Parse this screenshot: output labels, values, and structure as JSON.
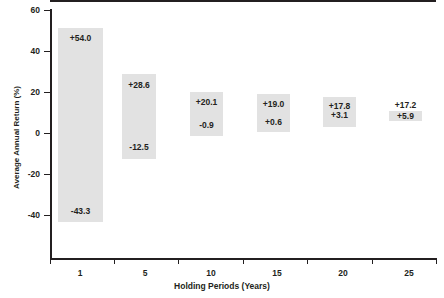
{
  "chart_data": {
    "type": "bar",
    "title": "",
    "xlabel": "Holding Periods (Years)",
    "ylabel": "Average Annual Return (%)",
    "categories": [
      "1",
      "5",
      "10",
      "15",
      "20",
      "25"
    ],
    "ylim": [
      -52,
      60
    ],
    "yticks": [
      60,
      40,
      20,
      0,
      -20,
      -40
    ],
    "ytick_labels": [
      "60",
      "40",
      "20",
      "0",
      "-20",
      "-40"
    ],
    "grid": false,
    "legend": null,
    "series": [
      {
        "name": "Best Average Annual Return",
        "values": [
          54.0,
          28.6,
          20.1,
          19.0,
          17.8,
          17.2
        ],
        "labels": [
          "+54.0",
          "+28.6",
          "+20.1",
          "+19.0",
          "+17.8",
          "+17.2"
        ]
      },
      {
        "name": "Worst Average Annual Return",
        "values": [
          -43.3,
          -12.5,
          -0.9,
          0.6,
          3.1,
          5.9
        ],
        "labels": [
          "-43.3",
          "-12.5",
          "-0.9",
          "+0.6",
          "+3.1",
          "+5.9"
        ]
      }
    ],
    "bar_color": "#e2e2e2",
    "axis_color": "#231f20",
    "zero_reference_line": 0
  },
  "bars": [
    {
      "category": "1",
      "high_label": "+54.0",
      "low_label": "-43.3",
      "x": 58,
      "width": 45,
      "top": 28,
      "bottom": 222,
      "high_label_x": 58,
      "high_label_y": 33,
      "high_label_w": 45,
      "low_label_x": 58,
      "low_label_y": 206,
      "low_label_w": 45
    },
    {
      "category": "5",
      "high_label": "+28.6",
      "low_label": "-12.5",
      "x": 122,
      "width": 34,
      "top": 74,
      "bottom": 159,
      "high_label_x": 120,
      "high_label_y": 80,
      "high_label_w": 38,
      "low_label_x": 120,
      "low_label_y": 142,
      "low_label_w": 38
    },
    {
      "category": "10",
      "high_label": "+20.1",
      "low_label": "-0.9",
      "x": 190,
      "width": 33,
      "top": 92,
      "bottom": 136,
      "high_label_x": 189,
      "high_label_y": 97,
      "high_label_w": 35,
      "low_label_x": 189,
      "low_label_y": 120,
      "low_label_w": 35
    },
    {
      "category": "15",
      "high_label": "+19.0",
      "low_label": "+0.6",
      "x": 257,
      "width": 33,
      "top": 94,
      "bottom": 132,
      "high_label_x": 256,
      "high_label_y": 99,
      "high_label_w": 35,
      "low_label_x": 256,
      "low_label_y": 117,
      "low_label_w": 35
    },
    {
      "category": "20",
      "high_label": "+17.8",
      "low_label": "+3.1",
      "x": 323,
      "width": 33,
      "top": 97,
      "bottom": 127,
      "high_label_x": 322,
      "high_label_y": 101,
      "high_label_w": 35,
      "low_label_x": 322,
      "low_label_y": 110,
      "low_label_w": 35
    },
    {
      "category": "25",
      "high_label": "+17.2",
      "low_label": "+5.9",
      "x": 389,
      "width": 33,
      "top": 111,
      "bottom": 121,
      "high_label_x": 388,
      "high_label_y": 100,
      "high_label_w": 35,
      "low_label_x": 388,
      "low_label_y": 111,
      "low_label_w": 35
    }
  ],
  "axis": {
    "y_ticks": [
      {
        "label": "60",
        "y": 10
      },
      {
        "label": "40",
        "y": 51
      },
      {
        "label": "20",
        "y": 92
      },
      {
        "label": "0",
        "y": 133
      },
      {
        "label": "-20",
        "y": 174
      },
      {
        "label": "-40",
        "y": 215
      }
    ],
    "x_ticks": [
      {
        "label": "1",
        "label_x": 80,
        "tick_x": 50
      },
      {
        "label": "5",
        "label_x": 145,
        "tick_x": 114
      },
      {
        "label": "10",
        "label_x": 211,
        "tick_x": 178
      },
      {
        "label": "15",
        "label_x": 277,
        "tick_x": 243
      },
      {
        "label": "20",
        "label_x": 343,
        "tick_x": 307
      },
      {
        "label": "25",
        "label_x": 409,
        "tick_x": 372
      }
    ],
    "x_tick_end": 436,
    "zero_y": 133
  }
}
